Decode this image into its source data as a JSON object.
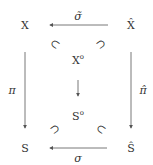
{
  "nodes": {
    "X": {
      "base": "X",
      "sup": ""
    },
    "Xhat": {
      "base": "X̂",
      "sup": ""
    },
    "Xo": {
      "base": "X",
      "sup": "o"
    },
    "So": {
      "base": "S",
      "sup": "o"
    },
    "S": {
      "base": "S",
      "sup": ""
    },
    "Shat": {
      "base": "Ŝ",
      "sup": ""
    }
  },
  "arrows": {
    "top": {
      "from": "X̂",
      "to": "X",
      "label": "σ̃"
    },
    "left": {
      "from": "X",
      "to": "S",
      "label": "π"
    },
    "right": {
      "from": "X̂",
      "to": "Ŝ",
      "label": "π̂"
    },
    "middle": {
      "from": "X°",
      "to": "S°",
      "label": ""
    },
    "bottom": {
      "from": "Ŝ",
      "to": "S",
      "label": "σ"
    }
  },
  "inclusions": [
    "⊂",
    "⊃",
    "⊃",
    "⊂"
  ],
  "colors": {
    "stroke": "#555555",
    "text": "#333333"
  }
}
